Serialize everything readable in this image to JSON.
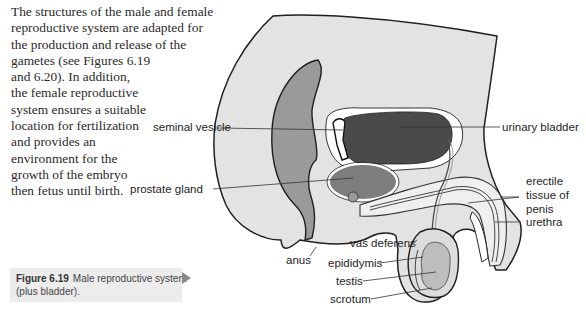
{
  "body_text": {
    "lines": [
      "The structures of the male and female",
      "reproductive system are adapted for",
      "the production and release of the",
      "gametes (see Figures 6.19",
      "and 6.20). In addition,",
      "the female reproductive",
      "system ensures a suitable",
      "location for fertilization",
      "and provides an",
      "environment for the",
      "growth of the embryo",
      "then fetus until birth."
    ]
  },
  "figure": {
    "number": "Figure 6.19",
    "caption": "Male reproductive system (plus bladder).",
    "caption_line1": "Male reproductive system",
    "caption_line2": "(plus bladder).",
    "labels": {
      "seminal_vesicle": "seminal vesicle",
      "prostate_gland": "prostate gland",
      "urinary_bladder": "urinary bladder",
      "erectile_tissue_1": "erectile",
      "erectile_tissue_2": "tissue of",
      "erectile_tissue_3": "penis",
      "urethra": "urethra",
      "anus": "anus",
      "vas_deferens": "vas deferens",
      "epididymis": "epididymis",
      "testis": "testis",
      "scrotum": "scrotum"
    },
    "colors": {
      "body_fill": "#e3e3e3",
      "rectum_fill": "#9a9a9a",
      "bladder_fill": "#4a4a4a",
      "prostate_fill": "#7d7d7d",
      "testis_fill": "#bdbdbd",
      "erectile_fill": "#efefef",
      "caption_bg": "#ececec"
    }
  }
}
